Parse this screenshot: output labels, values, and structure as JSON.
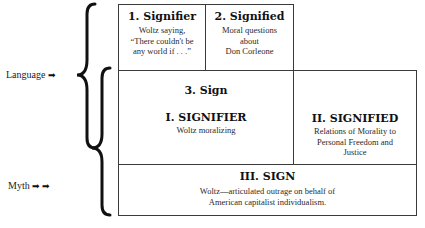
{
  "labels": {
    "language": "Language",
    "language_arrow": "➡",
    "myth": "Myth",
    "myth_arrows": "➡ ➡"
  },
  "boxes": {
    "signifier": {
      "title": "1. Signifier",
      "lines": [
        "Woltz saying,",
        "“There couldn't be",
        "any world if . . .”"
      ]
    },
    "signified": {
      "title": "2. Signified",
      "lines": [
        "Moral questions",
        "about",
        "Don Corleone"
      ]
    },
    "sign": {
      "title": "3. Sign"
    },
    "myth_signifier": {
      "title": "I. SIGNIFIER",
      "lines": [
        "Woltz moralizing"
      ]
    },
    "myth_signified": {
      "title": "II. SIGNIFIED",
      "lines": [
        "Relations of Morality to",
        "Personal Freedom and",
        "Justice"
      ]
    },
    "myth_sign": {
      "title": "III. SIGN",
      "lines": [
        "Woltz—articulated outrage on behalf of",
        "American capitalist individualism."
      ]
    }
  },
  "colors": {
    "border": "#3a3a3a",
    "text": "#1a1a1a",
    "background": "#ffffff"
  }
}
